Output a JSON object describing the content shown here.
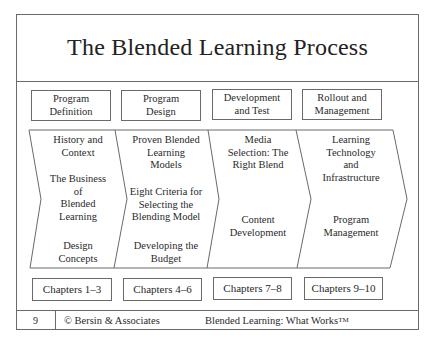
{
  "title": "The Blended Learning Process",
  "phases": [
    {
      "label_line1": "Program",
      "label_line2": "Definition"
    },
    {
      "label_line1": "Program",
      "label_line2": "Design"
    },
    {
      "label_line1": "Development",
      "label_line2": "and Test"
    },
    {
      "label_line1": "Rollout and",
      "label_line2": "Management"
    }
  ],
  "chevrons": [
    {
      "topics": [
        {
          "lines": [
            "History and",
            "Context"
          ]
        },
        {
          "lines": [
            "The Business",
            "of",
            "Blended",
            "Learning"
          ]
        },
        {
          "lines": [
            "Design",
            "Concepts"
          ]
        }
      ]
    },
    {
      "topics": [
        {
          "lines": [
            "Proven Blended",
            "Learning",
            "Models"
          ]
        },
        {
          "lines": [
            "Eight Criteria for",
            "Selecting the",
            "Blending Model"
          ]
        },
        {
          "lines": [
            "Developing the",
            "Budget"
          ]
        }
      ]
    },
    {
      "topics": [
        {
          "lines": [
            "Media",
            "Selection: The",
            "Right Blend"
          ]
        },
        {
          "lines": [
            "Content",
            "Development"
          ]
        }
      ]
    },
    {
      "topics": [
        {
          "lines": [
            "Learning",
            "Technology",
            "and",
            "Infrastructure"
          ]
        },
        {
          "lines": [
            "Program",
            "Management"
          ]
        }
      ]
    }
  ],
  "chapters": [
    "Chapters 1–3",
    "Chapters 4–6",
    "Chapters 7–8",
    "Chapters 9–10"
  ],
  "footer": {
    "page_number": "9",
    "copyright": "© Bersin & Associates",
    "book_title": "Blended Learning: What Works",
    "trademark": "TM"
  },
  "colors": {
    "line": "#6a6a6a",
    "text": "#2a2a2a",
    "background": "#ffffff"
  }
}
